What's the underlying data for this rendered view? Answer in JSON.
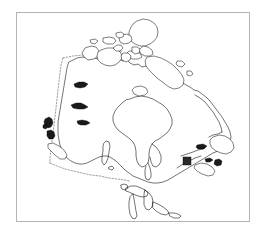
{
  "figure": {
    "kind": "outline-map",
    "region": "Canada",
    "title": "",
    "caption": "",
    "background_color": "#ffffff",
    "frame": {
      "visible": true,
      "color": "#b4b4b4",
      "x": 16,
      "y": 12,
      "width": 234,
      "height": 210
    }
  },
  "map": {
    "projection_note": "",
    "outline_color": "#000000",
    "fill_color": "#ffffff",
    "land_stroke_width": 0.55,
    "features": {
      "mainland_label": "Canada mainland coastline",
      "hudson_bay_label": "Hudson Bay",
      "great_lakes_label": "Great Lakes",
      "arctic_archipelago_label": "Arctic Archipelago",
      "pacific_islands_label": "Vancouver Island and Haida Gwaii",
      "atlantic_islands_label": "Newfoundland and Maritimes"
    },
    "border": {
      "name": "49th parallel international boundary",
      "style": "dashed",
      "color": "#555555"
    }
  },
  "markers": [
    {
      "name": "location-marker",
      "shape": "square",
      "color": "#2b2b2b",
      "label": "",
      "x": 170,
      "y": 148,
      "size": 8
    }
  ]
}
